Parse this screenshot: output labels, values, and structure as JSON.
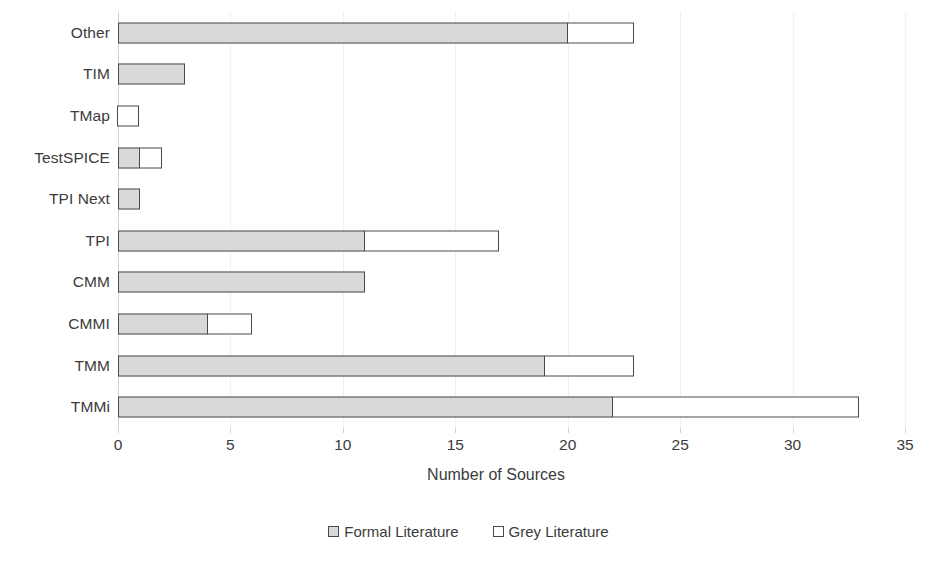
{
  "chart_data": {
    "type": "bar",
    "orientation": "horizontal",
    "stacked": true,
    "title": "",
    "xlabel": "Number of Sources",
    "ylabel": "",
    "xlim": [
      0,
      35
    ],
    "xticks": [
      0,
      5,
      10,
      15,
      20,
      25,
      30,
      35
    ],
    "grid": true,
    "legend_position": "bottom",
    "categories": [
      "Other",
      "TIM",
      "TMap",
      "TestSPICE",
      "TPI Next",
      "TPI",
      "CMM",
      "CMMI",
      "TMM",
      "TMMi"
    ],
    "series": [
      {
        "name": "Formal Literature",
        "color": "#d9d9d9",
        "values": [
          20,
          3,
          0,
          1,
          1,
          11,
          11,
          4,
          19,
          22
        ]
      },
      {
        "name": "Grey Literature",
        "color": "#ffffff",
        "values": [
          3,
          0,
          1,
          1,
          0,
          6,
          0,
          2,
          4,
          11
        ]
      }
    ],
    "totals": [
      23,
      3,
      1,
      2,
      1,
      17,
      11,
      6,
      23,
      33
    ]
  },
  "legend": {
    "items": [
      {
        "label": "Formal Literature",
        "swatch": "formal"
      },
      {
        "label": "Grey Literature",
        "swatch": "grey"
      }
    ]
  }
}
